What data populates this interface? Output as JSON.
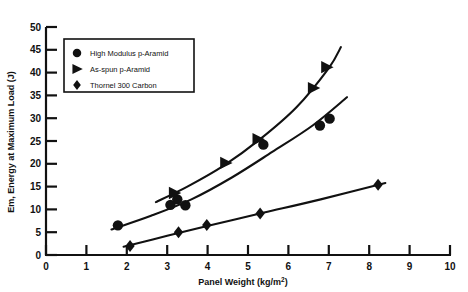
{
  "chart_data": {
    "type": "scatter",
    "title": "",
    "xlabel": "Panel Weight (kg/m2)",
    "xlabel_base": "Panel Weight (kg/m",
    "xlabel_sup": "2",
    "xlabel_tail": ")",
    "ylabel": "Em, Energy at Maximum Load (J)",
    "xlim": [
      0,
      10
    ],
    "ylim": [
      0,
      50
    ],
    "xticks": [
      0,
      1,
      2,
      3,
      4,
      5,
      6,
      7,
      8,
      9,
      10
    ],
    "yticks": [
      0,
      5,
      10,
      15,
      20,
      25,
      30,
      35,
      40,
      45,
      50
    ],
    "xtick_labels": [
      "0",
      "1",
      "2",
      "3",
      "4",
      "5",
      "6",
      "7",
      "8",
      "9",
      "10"
    ],
    "ytick_labels": [
      "0",
      "5",
      "10",
      "15",
      "20",
      "25",
      "30",
      "35",
      "40",
      "45",
      "50"
    ],
    "grid": false,
    "legend_position": "upper-left",
    "marker_color": "#111111",
    "line_color": "#111111",
    "series": [
      {
        "name": "High Modulus p-Aramid",
        "marker": "circle",
        "points": [
          {
            "x": 1.78,
            "y": 6.5
          },
          {
            "x": 3.08,
            "y": 11.0
          },
          {
            "x": 3.25,
            "y": 12.2
          },
          {
            "x": 3.45,
            "y": 10.9
          },
          {
            "x": 5.38,
            "y": 24.2
          },
          {
            "x": 6.78,
            "y": 28.4
          },
          {
            "x": 7.02,
            "y": 29.9
          }
        ],
        "trend": [
          {
            "x": 1.62,
            "y": 5.6
          },
          {
            "x": 2.6,
            "y": 8.6
          },
          {
            "x": 3.6,
            "y": 12.2
          },
          {
            "x": 4.6,
            "y": 17.0
          },
          {
            "x": 5.6,
            "y": 22.6
          },
          {
            "x": 6.6,
            "y": 28.4
          },
          {
            "x": 7.45,
            "y": 34.6
          }
        ]
      },
      {
        "name": "As-spun p-Aramid",
        "marker": "triangle",
        "points": [
          {
            "x": 3.18,
            "y": 13.6
          },
          {
            "x": 4.45,
            "y": 20.2
          },
          {
            "x": 5.25,
            "y": 25.4
          },
          {
            "x": 6.62,
            "y": 36.6
          },
          {
            "x": 6.95,
            "y": 41.2
          }
        ],
        "trend": [
          {
            "x": 2.72,
            "y": 11.6
          },
          {
            "x": 3.5,
            "y": 15.0
          },
          {
            "x": 4.4,
            "y": 19.6
          },
          {
            "x": 5.3,
            "y": 25.4
          },
          {
            "x": 6.2,
            "y": 32.4
          },
          {
            "x": 7.0,
            "y": 41.0
          },
          {
            "x": 7.3,
            "y": 45.6
          }
        ]
      },
      {
        "name": "Thornel 300 Carbon",
        "marker": "diamond",
        "points": [
          {
            "x": 2.08,
            "y": 2.0
          },
          {
            "x": 3.28,
            "y": 5.0
          },
          {
            "x": 3.98,
            "y": 6.6
          },
          {
            "x": 5.3,
            "y": 9.1
          },
          {
            "x": 8.22,
            "y": 15.4
          }
        ],
        "trend": [
          {
            "x": 1.92,
            "y": 1.8
          },
          {
            "x": 3.0,
            "y": 4.2
          },
          {
            "x": 4.2,
            "y": 6.8
          },
          {
            "x": 5.4,
            "y": 9.3
          },
          {
            "x": 6.8,
            "y": 12.2
          },
          {
            "x": 8.4,
            "y": 15.8
          }
        ]
      }
    ],
    "legend": [
      {
        "label": "High Modulus p-Aramid",
        "marker": "circle"
      },
      {
        "label": "As-spun p-Aramid",
        "marker": "triangle"
      },
      {
        "label": "Thornel 300 Carbon",
        "marker": "diamond"
      }
    ]
  }
}
